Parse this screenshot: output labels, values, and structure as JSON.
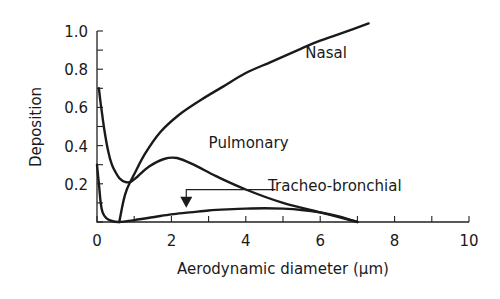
{
  "chart_data": {
    "type": "line",
    "title": "",
    "xlabel": "Aerodynamic diameter (µm)",
    "ylabel": "Deposition",
    "xlim": [
      0,
      10
    ],
    "ylim": [
      0,
      1.0
    ],
    "x_ticks": [
      0,
      1,
      2,
      3,
      4,
      5,
      6,
      7,
      8,
      9,
      10
    ],
    "x_tick_labels": [
      "0",
      "2",
      "4",
      "6",
      "8",
      "10"
    ],
    "x_tick_label_values": [
      0,
      2,
      4,
      6,
      8,
      10
    ],
    "y_ticks": [
      0,
      0.1,
      0.2,
      0.3,
      0.4,
      0.5,
      0.6,
      0.7,
      0.8,
      0.9,
      1.0
    ],
    "y_tick_labels": [
      "0.2",
      "0.4",
      "0.6",
      "0.8",
      "1.0"
    ],
    "y_tick_label_values": [
      0.2,
      0.4,
      0.6,
      0.8,
      1.0
    ],
    "grid": false,
    "legend": "inline labels",
    "series": [
      {
        "name": "Nasal",
        "x": [
          0.6,
          0.7,
          0.8,
          1.0,
          1.3,
          1.7,
          2.2,
          2.8,
          3.4,
          4.0,
          4.7,
          5.4,
          6.0,
          6.6,
          7.3
        ],
        "y": [
          0.0,
          0.1,
          0.17,
          0.25,
          0.36,
          0.47,
          0.56,
          0.64,
          0.71,
          0.78,
          0.84,
          0.9,
          0.95,
          0.99,
          1.04
        ],
        "label_pos": [
          5.6,
          0.86
        ]
      },
      {
        "name": "Pulmonary",
        "x": [
          0.05,
          0.1,
          0.2,
          0.3,
          0.4,
          0.5,
          0.6,
          0.75,
          0.9,
          1.1,
          1.4,
          1.8,
          2.15,
          2.6,
          3.2,
          4.0,
          5.0,
          6.0,
          7.0
        ],
        "y": [
          0.7,
          0.62,
          0.48,
          0.37,
          0.3,
          0.26,
          0.23,
          0.21,
          0.21,
          0.24,
          0.29,
          0.33,
          0.335,
          0.3,
          0.24,
          0.17,
          0.1,
          0.05,
          0.0
        ],
        "label_pos": [
          3.0,
          0.39
        ]
      },
      {
        "name": "Tracheo-bronchial",
        "x": [
          0.0,
          0.05,
          0.1,
          0.15,
          0.25,
          0.4,
          0.6,
          1.0,
          1.5,
          2.0,
          2.5,
          3.0,
          3.5,
          4.0,
          4.5,
          5.0,
          5.5,
          6.0,
          6.5,
          7.0
        ],
        "y": [
          0.3,
          0.2,
          0.1,
          0.05,
          0.02,
          0.005,
          0.0,
          0.01,
          0.025,
          0.04,
          0.05,
          0.06,
          0.066,
          0.07,
          0.072,
          0.07,
          0.063,
          0.05,
          0.03,
          0.0
        ],
        "label_pos": [
          4.6,
          0.16
        ],
        "annotation": {
          "type": "arrow",
          "from": [
            4.8,
            0.17
          ],
          "corner": [
            2.4,
            0.17
          ],
          "to": [
            2.4,
            0.08
          ]
        }
      }
    ]
  }
}
